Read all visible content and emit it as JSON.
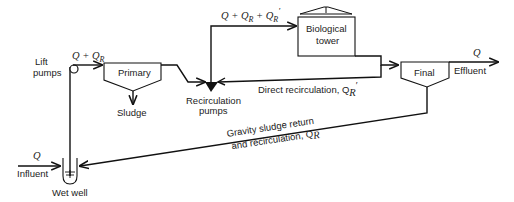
{
  "diagram": {
    "type": "process-flow",
    "nodes": {
      "lift_pumps": "Lift\npumps",
      "lift_pumps_l1": "Lift",
      "lift_pumps_l2": "pumps",
      "primary": "Primary",
      "sludge": "Sludge",
      "recirc_pumps_l1": "Recirculation",
      "recirc_pumps_l2": "pumps",
      "bio_tower_l1": "Biological",
      "bio_tower_l2": "tower",
      "final": "Final",
      "effluent": "Effluent",
      "influent": "Influent",
      "wet_well": "Wet well"
    },
    "flows": {
      "after_lift": "Q + Q",
      "after_lift_sub": "R",
      "to_tower": "Q + Q",
      "to_tower_sub1": "R",
      "to_tower_mid": " + Q",
      "to_tower_sub2": "R",
      "to_tower_prime": "′",
      "effluent_q": "Q",
      "influent_q": "Q",
      "direct_recirc": "Direct recirculation, Q",
      "direct_recirc_sub": "R",
      "direct_recirc_prime": "′",
      "gravity_l1": "Gravity sludge return",
      "gravity_l2": "and recirculation, Q",
      "gravity_sub": "R"
    },
    "edges": [
      {
        "from": "influent",
        "to": "wet_well",
        "label": "Q"
      },
      {
        "from": "wet_well",
        "to": "lift_pumps"
      },
      {
        "from": "lift_pumps",
        "to": "primary",
        "label": "Q + Q_R"
      },
      {
        "from": "primary",
        "to": "sludge"
      },
      {
        "from": "primary",
        "to": "recirculation_pumps"
      },
      {
        "from": "recirculation_pumps",
        "to": "biological_tower",
        "label": "Q + Q_R + Q_R'"
      },
      {
        "from": "biological_tower",
        "to": "final"
      },
      {
        "from": "biological_tower",
        "to": "recirculation_pumps",
        "label": "Direct recirculation, Q_R'"
      },
      {
        "from": "final",
        "to": "effluent",
        "label": "Q"
      },
      {
        "from": "final",
        "to": "wet_well",
        "label": "Gravity sludge return and recirculation, Q_R"
      }
    ]
  }
}
